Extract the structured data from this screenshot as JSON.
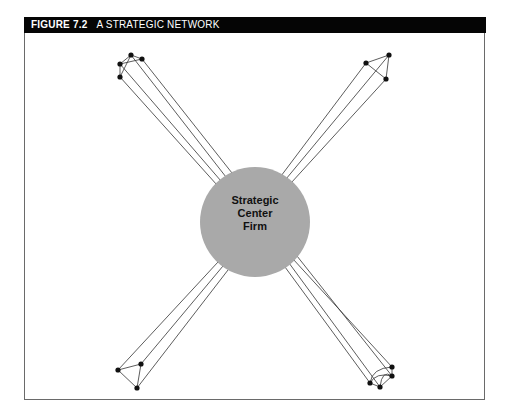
{
  "figure": {
    "number": "FIGURE 7.2",
    "title": "A STRATEGIC NETWORK"
  },
  "center": {
    "lines": [
      "Strategic",
      "Center",
      "Firm"
    ],
    "fill": "#a9a9a9"
  },
  "colors": {
    "header_bg": "#050505",
    "header_text": "#ffffff",
    "line": "#333333",
    "node": "#111111"
  },
  "clusters": [
    {
      "name": "top-left",
      "nodes": [
        [
          131,
          55
        ],
        [
          142,
          59
        ],
        [
          120,
          64
        ],
        [
          120,
          77
        ]
      ]
    },
    {
      "name": "top-right",
      "nodes": [
        [
          366,
          63
        ],
        [
          389,
          55
        ],
        [
          386,
          79
        ]
      ]
    },
    {
      "name": "bottom-left",
      "nodes": [
        [
          118,
          370
        ],
        [
          141,
          364
        ],
        [
          137,
          388
        ]
      ]
    },
    {
      "name": "bottom-right",
      "nodes": [
        [
          370,
          383
        ],
        [
          380,
          387
        ],
        [
          392,
          367
        ],
        [
          392,
          376
        ]
      ]
    }
  ]
}
